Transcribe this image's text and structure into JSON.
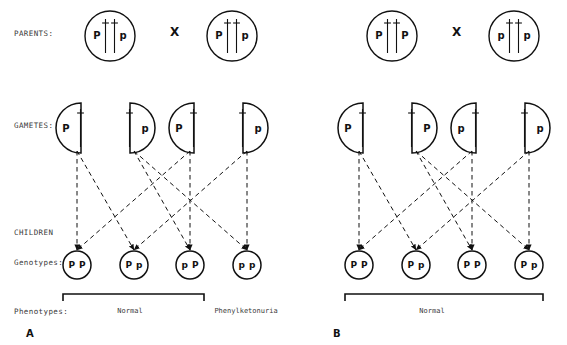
{
  "figure": {
    "row_labels": {
      "parents": "PARENTS:",
      "gametes": "GAMETES:",
      "children": "CHILDREN",
      "genotypes": "Genotypes:",
      "phenotypes": "Phenotypes:"
    },
    "cross_symbol": "X"
  },
  "panels": [
    {
      "letter": "A",
      "parents": [
        {
          "alleles": [
            "P",
            "p"
          ]
        },
        {
          "alleles": [
            "P",
            "p"
          ]
        }
      ],
      "gametes": [
        {
          "allele": "P",
          "orientation": "flat-right"
        },
        {
          "allele": "p",
          "orientation": "flat-left"
        },
        {
          "allele": "P",
          "orientation": "flat-right"
        },
        {
          "allele": "p",
          "orientation": "flat-left"
        }
      ],
      "children": [
        {
          "alleles": [
            "P",
            "P"
          ]
        },
        {
          "alleles": [
            "P",
            "p"
          ]
        },
        {
          "alleles": [
            "p",
            "P"
          ]
        },
        {
          "alleles": [
            "p",
            "p"
          ]
        }
      ],
      "phenotypes": [
        {
          "label": "Normal",
          "spans_children": [
            0,
            1,
            2
          ],
          "bracketed": true
        },
        {
          "label": "Phenylketonuria",
          "spans_children": [
            3
          ],
          "bracketed": false
        }
      ]
    },
    {
      "letter": "B",
      "parents": [
        {
          "alleles": [
            "P",
            "P"
          ]
        },
        {
          "alleles": [
            "p",
            "p"
          ]
        }
      ],
      "gametes": [
        {
          "allele": "P",
          "orientation": "flat-right"
        },
        {
          "allele": "P",
          "orientation": "flat-left"
        },
        {
          "allele": "p",
          "orientation": "flat-right"
        },
        {
          "allele": "p",
          "orientation": "flat-left"
        }
      ],
      "children": [
        {
          "alleles": [
            "P",
            "P"
          ]
        },
        {
          "alleles": [
            "P",
            "p"
          ]
        },
        {
          "alleles": [
            "P",
            "P"
          ]
        },
        {
          "alleles": [
            "P",
            "p"
          ]
        }
      ],
      "phenotypes": [
        {
          "label": "Normal",
          "spans_children": [
            0,
            1,
            2,
            3
          ],
          "bracketed": true
        }
      ]
    }
  ],
  "colors": {
    "ink": "#111111",
    "label_ink": "#3a3a3a",
    "background": "#ffffff"
  }
}
